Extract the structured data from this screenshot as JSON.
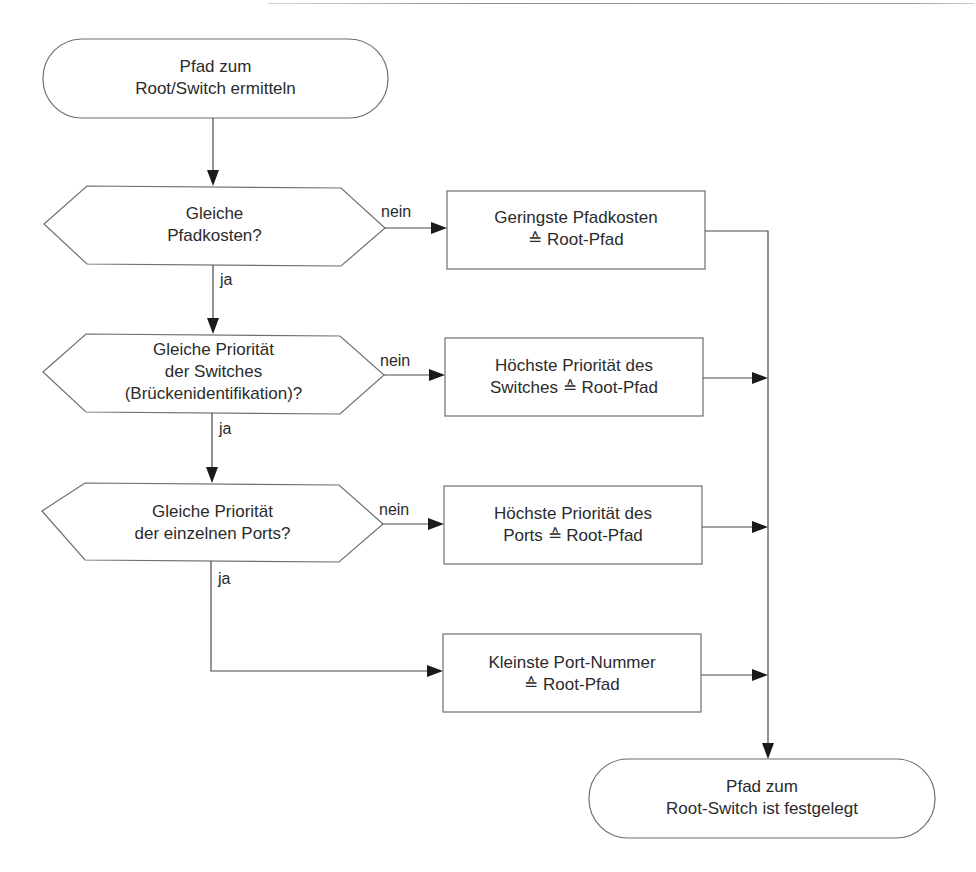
{
  "diagram": {
    "type": "flowchart",
    "nodes": {
      "start": {
        "shape": "terminator",
        "lines": [
          "Pfad zum",
          "Root/Switch ermitteln"
        ]
      },
      "decision1": {
        "shape": "hexagon-decision",
        "lines": [
          "Gleiche",
          "Pfadkosten?"
        ]
      },
      "result1": {
        "shape": "process",
        "lines": [
          "Geringste Pfadkosten",
          "≙ Root-Pfad"
        ]
      },
      "decision2": {
        "shape": "hexagon-decision",
        "lines": [
          "Gleiche Priorität",
          "der Switches",
          "(Brückenidentifikation)?"
        ]
      },
      "result2": {
        "shape": "process",
        "lines": [
          "Höchste Priorität des",
          "Switches  ≙  Root-Pfad"
        ]
      },
      "decision3": {
        "shape": "hexagon-decision",
        "lines": [
          "Gleiche Priorität",
          "der einzelnen Ports?"
        ]
      },
      "result3": {
        "shape": "process",
        "lines": [
          "Höchste Priorität des",
          "Ports  ≙  Root-Pfad"
        ]
      },
      "result4": {
        "shape": "process",
        "lines": [
          "Kleinste Port-Nummer",
          "≙ Root-Pfad"
        ]
      },
      "end": {
        "shape": "terminator",
        "lines": [
          "Pfad zum",
          "Root-Switch ist festgelegt"
        ]
      }
    },
    "edges": [
      {
        "from": "start",
        "to": "decision1",
        "label": ""
      },
      {
        "from": "decision1",
        "to": "result1",
        "label": "nein"
      },
      {
        "from": "decision1",
        "to": "decision2",
        "label": "ja"
      },
      {
        "from": "decision2",
        "to": "result2",
        "label": "nein"
      },
      {
        "from": "decision2",
        "to": "decision3",
        "label": "ja"
      },
      {
        "from": "decision3",
        "to": "result3",
        "label": "nein"
      },
      {
        "from": "decision3",
        "to": "result4",
        "label": "ja"
      },
      {
        "from": "result1",
        "to": "end",
        "label": ""
      },
      {
        "from": "result2",
        "to": "end",
        "label": ""
      },
      {
        "from": "result3",
        "to": "end",
        "label": ""
      },
      {
        "from": "result4",
        "to": "end",
        "label": ""
      }
    ],
    "edge_labels": {
      "no": "nein",
      "yes": "ja"
    }
  }
}
